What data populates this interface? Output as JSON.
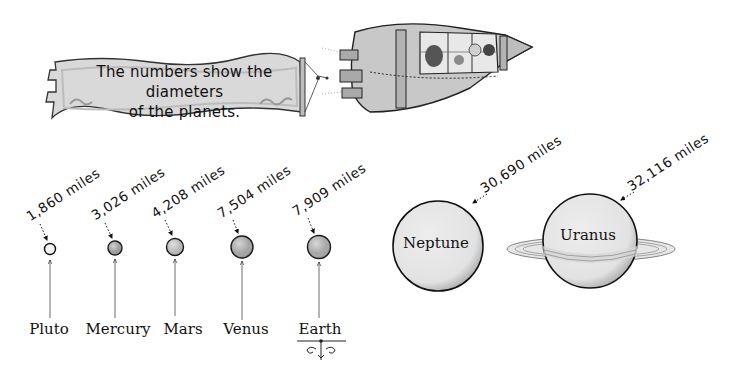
{
  "banner": {
    "line1": "The numbers show the diameters",
    "line2": "of the planets."
  },
  "illustration": {
    "rocket": "rocket-ship-with-passengers"
  },
  "planets": [
    {
      "name": "Pluto",
      "diameter": "1,860 miles",
      "color": "#f2f2f2"
    },
    {
      "name": "Mercury",
      "diameter": "3,026 miles",
      "color": "#9a9a9a"
    },
    {
      "name": "Mars",
      "diameter": "4,208 miles",
      "color": "#b9b9b9"
    },
    {
      "name": "Venus",
      "diameter": "7,504 miles",
      "color": "#a3a3a3"
    },
    {
      "name": "Earth",
      "diameter": "7,909 miles",
      "color": "#a6a6a6"
    },
    {
      "name": "Neptune",
      "diameter": "30,690 miles",
      "color": "#e4e4e4"
    },
    {
      "name": "Uranus",
      "diameter": "32,116 miles",
      "color": "#dcdcdc"
    }
  ]
}
